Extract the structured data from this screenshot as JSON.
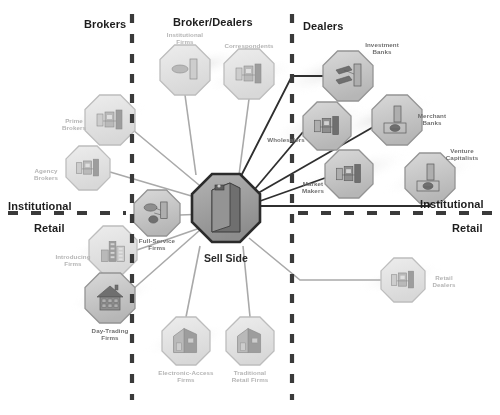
{
  "diagram": {
    "background": "#ffffff",
    "hub": {
      "label": "Sell Side",
      "icon": "building-tower-icon"
    },
    "headers": [
      {
        "id": "brokers",
        "label": "Brokers",
        "x": 84,
        "y": 18,
        "tone": "dark"
      },
      {
        "id": "broker-dealers",
        "label": "Broker/Dealers",
        "x": 173,
        "y": 16,
        "tone": "dark"
      },
      {
        "id": "dealers",
        "label": "Dealers",
        "x": 303,
        "y": 20,
        "tone": "dark"
      },
      {
        "id": "institutional-left",
        "label": "Institutional",
        "x": 8,
        "y": 200,
        "tone": "dark"
      },
      {
        "id": "retail-left",
        "label": "Retail",
        "x": 34,
        "y": 222,
        "tone": "dark"
      },
      {
        "id": "institutional-right",
        "label": "Institutional",
        "x": 420,
        "y": 198,
        "tone": "dark"
      },
      {
        "id": "retail-right",
        "label": "Retail",
        "x": 452,
        "y": 222,
        "tone": "dark"
      }
    ],
    "nodes": [
      {
        "id": "institutional-firms",
        "label": "Institutional\nFirms",
        "icon": "office-desk-icon",
        "cx": 185,
        "cy": 70,
        "r": 25,
        "tone": "lt",
        "lx": 185,
        "ly": 31
      },
      {
        "id": "correspondents",
        "label": "Correspondents",
        "icon": "trading-desk-icon",
        "cx": 249,
        "cy": 74,
        "r": 25,
        "tone": "lt",
        "lx": 249,
        "ly": 42
      },
      {
        "id": "prime-brokers",
        "label": "Prime\nBrokers",
        "icon": "trading-desk-icon",
        "cx": 110,
        "cy": 120,
        "r": 25,
        "tone": "lt",
        "lx": 74,
        "ly": 117
      },
      {
        "id": "agency-brokers",
        "label": "Agency\nBrokers",
        "icon": "trading-desk-icon",
        "cx": 88,
        "cy": 168,
        "r": 22,
        "tone": "lt",
        "lx": 46,
        "ly": 167
      },
      {
        "id": "full-service-firms",
        "label": "Full-Service\nFirms",
        "icon": "advisor-desk-icon",
        "cx": 157,
        "cy": 213,
        "r": 23,
        "tone": "dk",
        "lx": 157,
        "ly": 237
      },
      {
        "id": "introducing-firms",
        "label": "Introducing\nFirms",
        "icon": "city-buildings-icon",
        "cx": 113,
        "cy": 250,
        "r": 24,
        "tone": "lt",
        "lx": 73,
        "ly": 253
      },
      {
        "id": "day-trading-firms",
        "label": "Day-Trading\nFirms",
        "icon": "house-icon",
        "cx": 110,
        "cy": 298,
        "r": 25,
        "tone": "dk",
        "lx": 110,
        "ly": 327
      },
      {
        "id": "electronic-access",
        "label": "Electronic-Access\nFirms",
        "icon": "house-building-icon",
        "cx": 186,
        "cy": 341,
        "r": 24,
        "tone": "lt",
        "lx": 186,
        "ly": 369
      },
      {
        "id": "traditional-retail",
        "label": "Traditional\nRetail Firms",
        "icon": "house-building-icon",
        "cx": 250,
        "cy": 341,
        "r": 24,
        "tone": "lt",
        "lx": 250,
        "ly": 369
      },
      {
        "id": "investment-banks",
        "label": "Investment\nBanks",
        "icon": "bank-desk-icon",
        "cx": 348,
        "cy": 76,
        "r": 25,
        "tone": "dk",
        "lx": 382,
        "ly": 41
      },
      {
        "id": "merchant-banks",
        "label": "Merchant\nBanks",
        "icon": "bank-vault-icon",
        "cx": 397,
        "cy": 120,
        "r": 25,
        "tone": "dk",
        "lx": 432,
        "ly": 112
      },
      {
        "id": "wholesalers",
        "label": "Wholesalers",
        "icon": "trading-desk-icon",
        "cx": 327,
        "cy": 126,
        "r": 24,
        "tone": "dk",
        "lx": 286,
        "ly": 136
      },
      {
        "id": "market-makers",
        "label": "Market\nMakers",
        "icon": "trading-desk-icon",
        "cx": 349,
        "cy": 174,
        "r": 24,
        "tone": "dk",
        "lx": 313,
        "ly": 180
      },
      {
        "id": "venture-capitalists",
        "label": "Venture\nCapitalists",
        "icon": "vault-door-icon",
        "cx": 430,
        "cy": 178,
        "r": 25,
        "tone": "dk",
        "lx": 462,
        "ly": 147
      },
      {
        "id": "retail-dealers",
        "label": "Retail\nDealers",
        "icon": "trading-desk-icon",
        "cx": 403,
        "cy": 280,
        "r": 22,
        "tone": "lt",
        "lx": 444,
        "ly": 274
      }
    ],
    "dividers": {
      "vertical": [
        {
          "id": "brokers-divider",
          "x": 132,
          "y1": 14,
          "y2": 400
        },
        {
          "id": "dealers-divider",
          "x": 292,
          "y1": 14,
          "y2": 400
        }
      ],
      "horizontal": [
        {
          "id": "institutional-retail-left",
          "y": 213,
          "x1": 8,
          "x2": 126
        },
        {
          "id": "institutional-retail-right",
          "y": 213,
          "x1": 298,
          "x2": 492
        }
      ]
    },
    "colors": {
      "node_fill": "#cfcfcf",
      "node_stroke": "#9a9a9a",
      "node_fill_light": "#dcdcdc",
      "hub_fill": "#9b9b9b",
      "hub_stroke": "#2b2b2b",
      "edge_dark": "#2f2f2f",
      "edge_light": "#a8a8a8",
      "divider": "#3a3a3a",
      "heading_text": "#1d1d1d",
      "caption_text": "#8f8f8f"
    }
  }
}
